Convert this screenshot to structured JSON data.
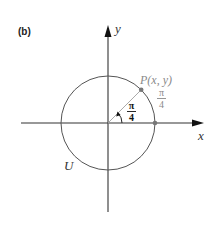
{
  "figure": {
    "panel_label": "(b)",
    "x_axis_label": "x",
    "y_axis_label": "y",
    "circle_label": "U",
    "point_label": "P(x, y)",
    "angle_label": {
      "numerator": "π",
      "denominator": "4"
    },
    "arc_label": {
      "numerator": "π",
      "denominator": "4"
    }
  },
  "colors": {
    "axis": "#333333",
    "circle": "#555555",
    "radius_ray": "#aaaaaa",
    "point": "#777777",
    "arc_label": "#8a8a8a",
    "angle_label": "#111111"
  }
}
